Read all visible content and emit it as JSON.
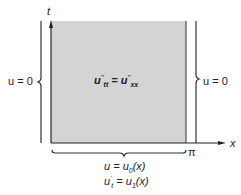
{
  "diagram": {
    "axes": {
      "t_label": "t",
      "x_label": "x",
      "pi_label": "π"
    },
    "region": {
      "equation": "u''tt = u''xx",
      "fill": "#d4d4d4"
    },
    "boundary_left": "u = 0",
    "boundary_right": "u = 0",
    "initial_conditions": [
      "u = u0(x)",
      "u't = u1(x)"
    ]
  }
}
